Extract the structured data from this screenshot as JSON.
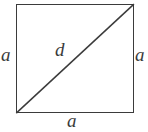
{
  "figure": {
    "type": "geometry-diagram",
    "shape": "square",
    "background_color": "#ffffff",
    "stroke_color": "#3b3b3b",
    "label_color": "#3b3b3b",
    "labels": {
      "side_left": "a",
      "side_right": "a",
      "side_bottom": "a",
      "diagonal": "d"
    },
    "geometry": {
      "square": {
        "x": 16,
        "y": 4,
        "width": 118,
        "height": 109
      },
      "diagonal": {
        "x1": 16,
        "y1": 113,
        "x2": 134,
        "y2": 4
      },
      "stroke_width": 1.6
    }
  }
}
